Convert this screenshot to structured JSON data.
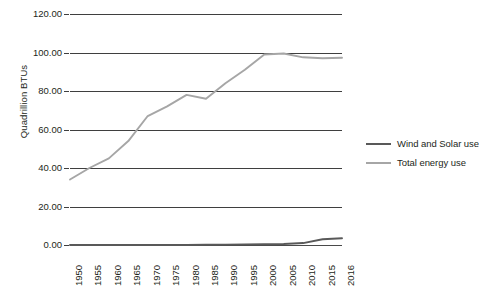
{
  "chart_data": {
    "type": "line",
    "title": "",
    "subtitle": "",
    "xlabel": "",
    "ylabel": "Quadrillion BTUs",
    "categories": [
      "1950",
      "1955",
      "1960",
      "1965",
      "1970",
      "1975",
      "1980",
      "1985",
      "1990",
      "1995",
      "2000",
      "2005",
      "2010",
      "2015",
      "2016"
    ],
    "ylim": [
      0,
      120
    ],
    "yticks": [
      "0.00",
      "20.00",
      "40.00",
      "60.00",
      "80.00",
      "100.00",
      "120.00"
    ],
    "ytick_values": [
      0,
      20,
      40,
      60,
      80,
      100,
      120
    ],
    "grid": "horizontal",
    "legend_position": "right",
    "series": [
      {
        "name": "Wind and Solar use",
        "color": "#595959",
        "values": [
          0.0,
          0.0,
          0.0,
          0.0,
          0.0,
          0.0,
          0.0,
          0.1,
          0.2,
          0.3,
          0.4,
          0.5,
          1.0,
          3.0,
          3.5
        ]
      },
      {
        "name": "Total energy use",
        "color": "#a6a6a6",
        "values": [
          34.0,
          40.0,
          45.0,
          54.0,
          67.0,
          72.0,
          78.0,
          76.0,
          84.0,
          91.0,
          99.0,
          99.5,
          97.5,
          97.0,
          97.3
        ]
      }
    ]
  },
  "legend": {
    "items": [
      {
        "label": "Wind and Solar use",
        "color": "#595959"
      },
      {
        "label": "Total energy use",
        "color": "#a6a6a6"
      }
    ]
  },
  "axes": {
    "y_title": "Quadrillion BTUs"
  }
}
